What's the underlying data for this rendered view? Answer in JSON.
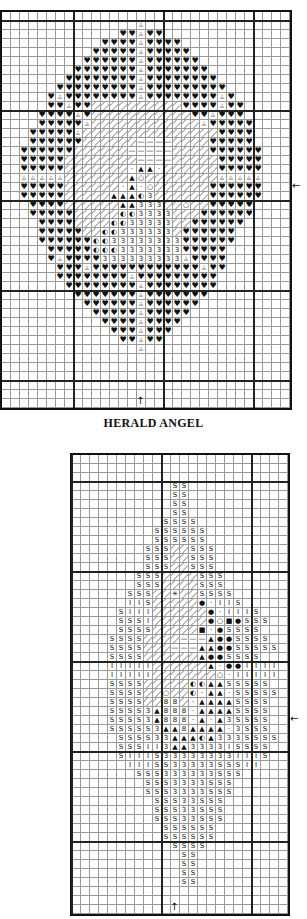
{
  "caption": "HERALD ANGEL",
  "symbols": {
    "H": "♥",
    "b": "♙",
    "d": "⁄",
    "t": "▲",
    "o": "○",
    "c": "◐",
    "3": "3",
    "S": "S",
    "i": "I",
    "8": "8",
    "n": "●",
    "q": "■",
    "m": "—",
    "k": "·",
    "x": "✳"
  },
  "charts": [
    {
      "name": "herald-angel-chart",
      "left": 0,
      "top": 10,
      "cols": 32,
      "rows": 44,
      "major_every": 10,
      "major_offset_x": 8,
      "major_offset_y": 1,
      "center_arrow_right_row": 19,
      "center_arrow_bottom_col": 15,
      "rows_data": [
        "................................",
        "...............b................",
        ".............HHbHH..............",
        "...........HHHHbHHHH............",
        "..........HHHHHbHHHHH...........",
        ".........HHHHHHbHHHHHH..........",
        "........HHHHHHHbHHHHHHH.........",
        ".......HHHHHHHHbHHHHHHHH........",
        "......HHHHHHHHHbHHHHHHHHH.......",
        ".....HbHHHHHHHHbHHHHHHHHbH......",
        ".....HHbHHddddddddddHHHHbHH.....",
        "....HHHHbHdddddddddddHHbHHH.....",
        "....HHHHHbddddddddddddbHHHHH....",
        "...HHHHHbdddddddddddddddHHHH....",
        "...HHHHHHddddddmmmmddddHHHHH....",
        "..HHHHHHddddddmmmmmddddHHHHHH...",
        "..HHHHHddddddddmmmmdddddHHHHH...",
        "..HHHHHdddddddkttkddddddHHHHH...",
        "..bbbbbdddddddtoddddddddbbbbb...",
        "..HHHHHddddddktkoddddddHHHHHH...",
        "..HHHHHdddddtttc3ddddddHHHHHH...",
        "...HHHHddddddtt333ddoddHHHHH....",
        "...HHHHHdddddcc3333dddHHHHHH....",
        "....HHHHddddcc33333ddHHHHHH.....",
        "....HHHHHddcc333333dHHHHHH......",
        "....HHHHHHcc33333333HHHHHH......",
        ".....HHHHHccc3333333HHHHH.......",
        ".....HbHHHH333333333bHHHH.......",
        "......HHHbHHHHHHHHHHHHbHH.......",
        "......HHHHHHHHbHHHHHHHHH........",
        ".......HHHHHHHHbHHHHHHHH........",
        "........HHHHHHHbHHHHHHH.........",
        ".........HHHHHHbHHHHHH..........",
        "..........HHHHHbHHHHH...........",
        "...........HHHHbHHHH............",
        "............HHHbHHH.............",
        ".............HHbHH..............",
        "...............b................",
        "................................",
        "................................",
        "................................",
        "................................",
        "................................",
        "................................"
      ]
    },
    {
      "name": "herald-angel-chart-2",
      "left": 70,
      "top": 453,
      "cols": 24,
      "rows": 51,
      "major_every": 10,
      "major_offset_x": 0,
      "major_offset_y": 3,
      "center_arrow_right_row": 29,
      "center_arrow_bottom_col": 11,
      "rows_data": [
        "........................",
        "........................",
        "........................",
        "...........SS...........",
        "...........SS...........",
        "...........SS...........",
        "...........SS...........",
        "..........SSSS..........",
        ".........SSSSSS.........",
        ".........SSSSSS.........",
        "........SSSddSSS........",
        "........SSSddSSS........",
        "........SSSddSSS........",
        ".......SSSddddSSS.......",
        ".......SSSddddSSS.......",
        "......SSSddxddSSSS......",
        "......iiSdddddnkiiS.....",
        ".....SiiiddddddnkiiiS...",
        ".....SSSiddddddnoqnSSS..",
        ".....SSSSdddddqknSSSS...",
        "....SSSSddddmmmtnnSSSS..",
        "....SSSSdddmmmttnnSSSSS.",
        "....SSSSddddddtnnSSSS...",
        "....iiiiiddddddtknniiii.",
        "....iiiiidddddddokiiiii.",
        "....SSSSdddddccttSSSSS..",
        "....SSSSddoddckttkSSSSS.",
        "....SSSSdd88dkttttSSSS..",
        "....SSSS3t888kttttSSSS..",
        "....SSSS3t888ktkt3SSSS..",
        "....SSSSS3tt8ttttk3SSS..",
        ".....SSSS33tttct333SSSS.",
        ".....SSSii3tt3333iSSSS..",
        ".....SiiiS33333333iiiS..",
        "......iiiSS33333SSSii...",
        ".......SSS333333SSS.....",
        "........SSS3333SSS......",
        "........SSS3333SSS......",
        ".........SSS33SSS.......",
        ".........SSS33SSS.......",
        ".........SSS33SSS.......",
        "..........SSSSSS........",
        "..........SSSSSS........",
        "...........SSSS.........",
        "............SS..........",
        "............SS..........",
        "............SS..........",
        "............SS..........",
        "........................",
        "........................",
        "........................"
      ]
    }
  ],
  "arrows": {
    "right": "←",
    "bottom": "↑"
  }
}
